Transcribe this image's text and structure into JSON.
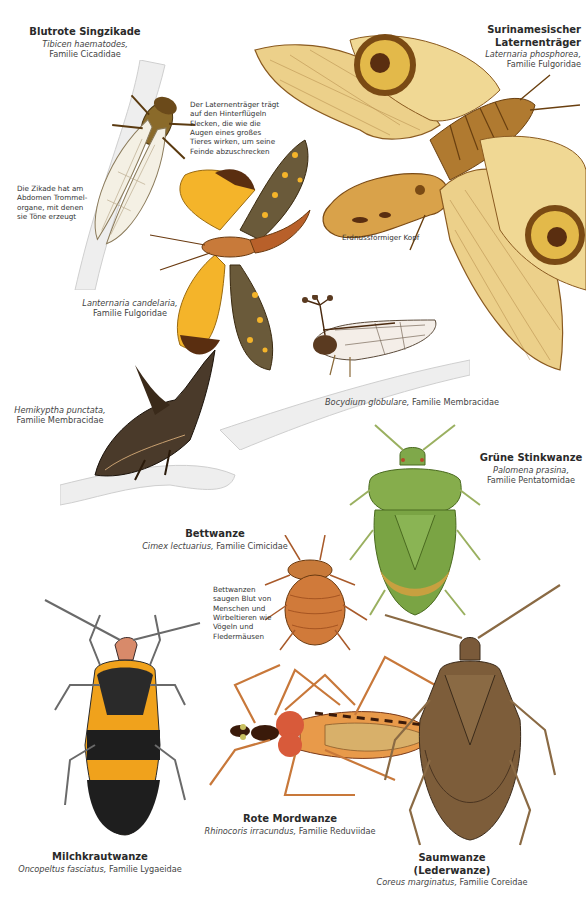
{
  "page": {
    "background": "#ffffff"
  },
  "species": [
    {
      "id": "blutrote-singzikade",
      "common": "Blutrote Singzikade",
      "latin": "Tibicen haematodes,",
      "family": "Familie Cicadidae"
    },
    {
      "id": "surinamesischer-laternentraeger",
      "common_line1": "Surinamesischer",
      "common_line2": "Laternenträger",
      "latin": "Laternaria phosphorea,",
      "family": "Familie Fulgoridae"
    },
    {
      "id": "lanternaria-candelaria",
      "latin": "Lanternaria candelaria,",
      "family": "Familie Fulgoridae"
    },
    {
      "id": "hemikyptha-punctata",
      "latin": "Hemikyptha punctata,",
      "family": "Familie Membracidae"
    },
    {
      "id": "bocydium-globulare",
      "latin": "Bocydium globulare,",
      "family": "Familie Membracidae"
    },
    {
      "id": "gruene-stinkwanze",
      "common": "Grüne Stinkwanze",
      "latin": "Palomena prasina,",
      "family": "Familie Pentatomidae"
    },
    {
      "id": "bettwanze",
      "common": "Bettwanze",
      "latin": "Cimex lectuarius,",
      "family": "Familie Cimicidae"
    },
    {
      "id": "milchkrautwanze",
      "common": "Milchkrautwanze",
      "latin": "Oncopeltus fasciatus,",
      "family": "Familie Lygaeidae"
    },
    {
      "id": "rote-mordwanze",
      "common": "Rote Mordwanze",
      "latin": "Rhinocoris irracundus,",
      "family": "Familie Reduviidae"
    },
    {
      "id": "saumwanze",
      "common_line1": "Saumwanze",
      "common_line2": "(Lederwanze)",
      "latin": "Coreus marginatus,",
      "family": "Familie Coreidae"
    }
  ],
  "notes": {
    "laternentraeger": [
      "Der Laternenträger trägt",
      "auf den Hinterflügeln",
      "Flecken, die wie die",
      "Augen eines großes",
      "Tieres wirken, um seine",
      "Feinde abzuschrecken"
    ],
    "zikade": [
      "Die Zikade hat am",
      "Abdomen Trommel-",
      "organe, mit denen",
      "sie Töne erzeugt"
    ],
    "kopf": "Erdnussförmiger Kopf",
    "bettwanze": [
      "Bettwanzen",
      "saugen Blut von",
      "Menschen und",
      "Wirbeltieren wie",
      "Vögeln und",
      "Fledermäusen"
    ]
  },
  "colors": {
    "lantern_wing": "#e8c77a",
    "lantern_vein": "#8a5a20",
    "candelaria_yellow": "#f2b22a",
    "green_bug": "#7fa84a",
    "red_bug": "#c8442a",
    "milkweed_orange": "#f0a21c",
    "brown_bug": "#7a5a3a",
    "branch": "#e9e9e9"
  }
}
